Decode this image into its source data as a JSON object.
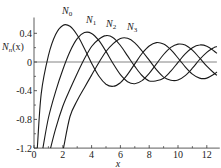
{
  "chart_data": {
    "type": "line",
    "title": "",
    "xlabel": "x",
    "ylabel": "N_n(x)",
    "xlim": [
      0,
      12.9
    ],
    "ylim": [
      -1.2,
      0.62
    ],
    "grid": false,
    "legend": "inline labels near curve peaks",
    "x_ticks": [
      0,
      2,
      4,
      6,
      8,
      10,
      12
    ],
    "x_minor_ticks": [
      1,
      3,
      5,
      7,
      9,
      11
    ],
    "y_ticks": [
      -1.2,
      -0.8,
      -0.4,
      0,
      0.4
    ],
    "y_tick_labels": [
      "-1.2",
      "-0.8",
      "-0.4",
      "0",
      "0.4"
    ],
    "x_tick_labels": [
      "0",
      "2",
      "4",
      "6",
      "8",
      "10",
      "12"
    ],
    "zero_line": true,
    "series": [
      {
        "name": "N0",
        "label_sub": "0",
        "x": [
          0.23,
          0.5,
          1,
          1.5,
          2,
          2.5,
          3,
          3.5,
          4,
          4.5,
          5,
          5.5,
          6,
          6.5,
          7,
          7.5,
          8,
          8.5,
          9,
          9.5,
          10,
          10.5,
          11,
          11.5,
          12,
          12.5,
          12.7
        ],
        "values": [
          -1.2,
          -0.445,
          0.088,
          0.382,
          0.51,
          0.498,
          0.377,
          0.189,
          -0.017,
          -0.195,
          -0.309,
          -0.339,
          -0.288,
          -0.173,
          -0.026,
          0.118,
          0.223,
          0.27,
          0.25,
          0.171,
          0.056,
          -0.067,
          -0.169,
          -0.225,
          -0.225,
          -0.171,
          -0.14
        ]
      },
      {
        "name": "N1",
        "label_sub": "1",
        "x": [
          0.62,
          1,
          1.5,
          2,
          2.5,
          3,
          3.5,
          4,
          4.5,
          5,
          5.5,
          6,
          6.5,
          7,
          7.5,
          8,
          8.5,
          9,
          9.5,
          10,
          10.5,
          11,
          11.5,
          12,
          12.5,
          12.7
        ],
        "values": [
          -1.2,
          -0.781,
          -0.412,
          -0.107,
          0.146,
          0.325,
          0.41,
          0.398,
          0.301,
          0.148,
          -0.024,
          -0.175,
          -0.274,
          -0.303,
          -0.259,
          -0.158,
          -0.026,
          0.104,
          0.203,
          0.249,
          0.235,
          0.164,
          0.057,
          -0.057,
          -0.154,
          -0.185
        ]
      },
      {
        "name": "N2",
        "label_sub": "2",
        "x": [
          1.15,
          1.5,
          2,
          2.5,
          3,
          3.5,
          4,
          4.5,
          5,
          5.5,
          6,
          6.5,
          7,
          7.5,
          8,
          8.5,
          9,
          9.5,
          10,
          10.5,
          11,
          11.5,
          12,
          12.5,
          12.7
        ],
        "values": [
          -1.2,
          -0.932,
          -0.617,
          -0.381,
          -0.16,
          0.045,
          0.216,
          0.318,
          0.368,
          0.339,
          0.23,
          0.085,
          -0.061,
          -0.188,
          -0.263,
          -0.262,
          -0.227,
          -0.128,
          -0.006,
          0.113,
          0.199,
          0.237,
          0.22,
          0.153,
          0.12
        ]
      },
      {
        "name": "N3",
        "label_sub": "3",
        "x": [
          2.05,
          2.5,
          3,
          3.5,
          4,
          4.5,
          5,
          5.5,
          6,
          6.5,
          7,
          7.5,
          8,
          8.5,
          9,
          9.5,
          10,
          10.5,
          11,
          11.5,
          12,
          12.5,
          12.7
        ],
        "values": [
          -1.2,
          -0.76,
          -0.538,
          -0.358,
          -0.182,
          -0.01,
          0.146,
          0.256,
          0.328,
          0.33,
          0.268,
          0.154,
          0.025,
          -0.107,
          -0.21,
          -0.254,
          -0.251,
          -0.19,
          -0.087,
          0.035,
          0.135,
          0.2,
          0.215
        ]
      }
    ]
  },
  "labels": {
    "y_axis": "N",
    "y_axis_sub": "n",
    "y_axis_rest": "(x)",
    "x_axis": "x",
    "series_prefix": "N"
  },
  "style": {
    "line_color": "#1a1a1a",
    "axis_color": "#333333",
    "zero_line_color": "#777777"
  }
}
